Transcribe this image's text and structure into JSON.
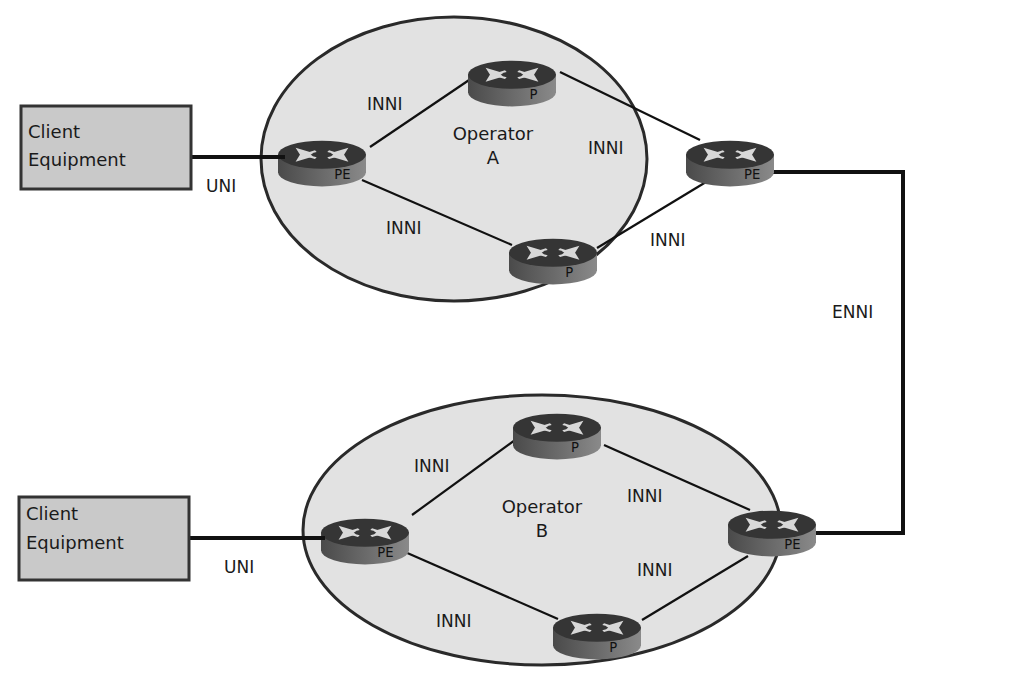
{
  "diagram": {
    "colors": {
      "background": "#ffffff",
      "cloud_fill": "#e2e2e2",
      "cloud_stroke": "#2a2a2a",
      "box_fill": "#c9c9c9",
      "box_stroke": "#333333",
      "router_top": "#3c3c3c",
      "router_side": "#6d6d6d",
      "router_arrows": "#d8d8d8",
      "link": "#111111"
    },
    "operator_a": {
      "name_line1": "Operator",
      "name_line2": "A",
      "routers": [
        {
          "id": "a-pe-left",
          "label": "PE"
        },
        {
          "id": "a-p-top",
          "label": "P"
        },
        {
          "id": "a-pe-right",
          "label": "PE"
        },
        {
          "id": "a-p-bottom",
          "label": "P"
        }
      ],
      "links": [
        {
          "from": "a-pe-left",
          "to": "a-p-top",
          "label": "INNI"
        },
        {
          "from": "a-p-top",
          "to": "a-pe-right",
          "label": "INNI"
        },
        {
          "from": "a-pe-left",
          "to": "a-p-bottom",
          "label": "INNI"
        },
        {
          "from": "a-p-bottom",
          "to": "a-pe-right",
          "label": "INNI"
        }
      ]
    },
    "operator_b": {
      "name_line1": "Operator",
      "name_line2": "B",
      "routers": [
        {
          "id": "b-pe-left",
          "label": "PE"
        },
        {
          "id": "b-p-top",
          "label": "P"
        },
        {
          "id": "b-pe-right",
          "label": "PE"
        },
        {
          "id": "b-p-bottom",
          "label": "P"
        }
      ],
      "links": [
        {
          "from": "b-pe-left",
          "to": "b-p-top",
          "label": "INNI"
        },
        {
          "from": "b-p-top",
          "to": "b-pe-right",
          "label": "INNI"
        },
        {
          "from": "b-pe-left",
          "to": "b-p-bottom",
          "label": "INNI"
        },
        {
          "from": "b-p-bottom",
          "to": "b-pe-right",
          "label": "INNI"
        }
      ]
    },
    "client_a": {
      "line1": "Client",
      "line2": "Equipment",
      "link_label": "UNI"
    },
    "client_b": {
      "line1": "Client",
      "line2": "Equipment",
      "link_label": "UNI"
    },
    "interconnect": {
      "label": "ENNI"
    }
  }
}
